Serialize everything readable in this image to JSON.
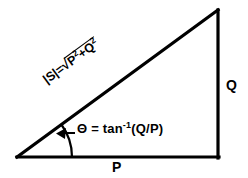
{
  "diagram": {
    "background_color": "#ffffff",
    "stroke_color": "#000000",
    "vertices": {
      "origin_label": "left-vertex",
      "apex_label": "top-right-vertex",
      "corner_label": "bottom-right-vertex"
    },
    "labels": {
      "base": "P",
      "vertical": "Q",
      "hypotenuse_prefix": "|S|=",
      "hypotenuse_radical": "√",
      "hypotenuse_operand_1": "P",
      "hypotenuse_exponent_1": "2",
      "hypotenuse_operator": "+",
      "hypotenuse_operand_2": "Q",
      "hypotenuse_exponent_2": "2",
      "angle_symbol": "Θ",
      "angle_equals": "=",
      "angle_function": "tan",
      "angle_exponent": "-1",
      "angle_argument": "(Q/P)"
    }
  }
}
